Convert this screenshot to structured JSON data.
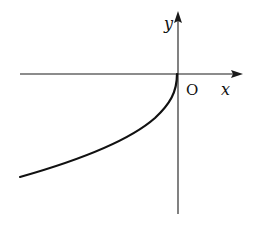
{
  "diagram": {
    "type": "function-graph",
    "axes": {
      "x_label": "x",
      "y_label": "y",
      "origin_label": "O"
    },
    "curve": {
      "description": "curve in third quadrant rising from lower-left to origin, becoming vertical (tangent to y-axis) at O",
      "start_px": [
        20,
        177
      ],
      "end_px": [
        177,
        74
      ]
    },
    "colors": {
      "background": "#ffffff",
      "stroke": "#111111"
    }
  }
}
